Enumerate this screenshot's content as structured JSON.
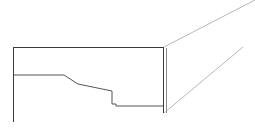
{
  "canvas": {
    "width": 255,
    "height": 131,
    "background_color": "#ffffff",
    "title": "CAD line drawing — stepped section profile with perspective edges"
  },
  "style": {
    "primary_stroke_color": "#3a3a3a",
    "secondary_stroke_color": "#555555",
    "faint_stroke_color": "#b8b8b8",
    "stroke_width_primary": 1,
    "stroke_width_faint": 1
  },
  "chart_data": {
    "type": "line",
    "xlabel": "",
    "ylabel": "",
    "xlim": [
      0,
      255
    ],
    "ylim": [
      131,
      0
    ],
    "grid": false,
    "legend": "none",
    "series": [
      {
        "name": "top-horizontal-edge",
        "color": "#3a3a3a",
        "points": [
          [
            13,
            47
          ],
          [
            163,
            47
          ]
        ]
      },
      {
        "name": "left-vertical-edge",
        "color": "#3a3a3a",
        "points": [
          [
            13,
            47
          ],
          [
            13,
            122
          ]
        ]
      },
      {
        "name": "stepped-profile",
        "color": "#555555",
        "points": [
          [
            14,
            75
          ],
          [
            64,
            75
          ],
          [
            78,
            84
          ],
          [
            112,
            91
          ],
          [
            112,
            104
          ],
          [
            116,
            104
          ],
          [
            116,
            106
          ],
          [
            163,
            106
          ]
        ]
      },
      {
        "name": "right-vertical-edge-outer",
        "color": "#3a3a3a",
        "points": [
          [
            163,
            47
          ],
          [
            163,
            113
          ]
        ]
      },
      {
        "name": "right-vertical-edge-inner",
        "color": "#8a8a8a",
        "points": [
          [
            166,
            48
          ],
          [
            166,
            113
          ]
        ]
      },
      {
        "name": "upper-perspective-diagonal",
        "color": "#b8b8b8",
        "points": [
          [
            164,
            47
          ],
          [
            255,
            0
          ]
        ]
      },
      {
        "name": "lower-perspective-diagonal",
        "color": "#b8b8b8",
        "points": [
          [
            164,
            113
          ],
          [
            243,
            47
          ]
        ]
      }
    ]
  },
  "labels": {
    "none_present": ""
  }
}
